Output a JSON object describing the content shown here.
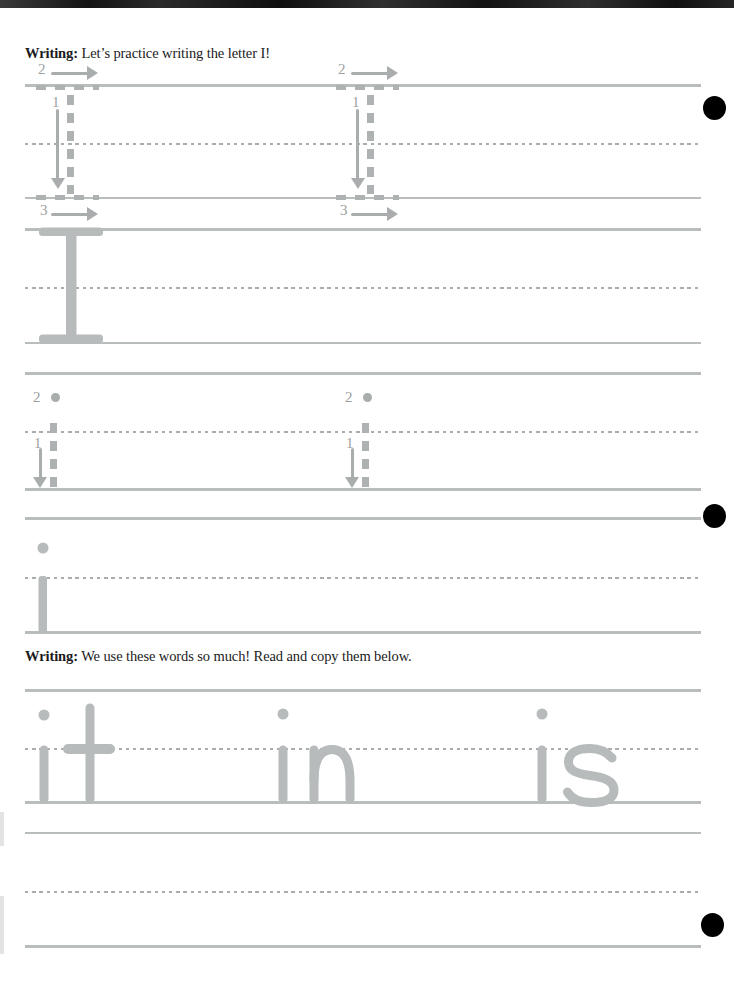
{
  "worksheet": {
    "instruction_uppercase": {
      "label": "Writing:",
      "text": " Let’s practice writing the letter I!"
    },
    "instruction_words": {
      "label": "Writing:",
      "text": " We use these words so much! Read and copy them below."
    },
    "uppercase_letter": "I",
    "lowercase_letter": "i",
    "uppercase_strokes": {
      "stroke_down": "1",
      "stroke_top": "2",
      "stroke_bottom": "3"
    },
    "lowercase_strokes": {
      "stroke_down": "1",
      "stroke_dot": "2"
    },
    "practice_words": [
      "it",
      "in",
      "is"
    ],
    "colors": {
      "guide_line": "#b9bdbd",
      "midline_dash": "#a9adad",
      "template_gray": "#aeb2b2",
      "traced_letter": "#b7bbbb",
      "punch_dot": "#000000",
      "heading_text": "#1b1b1b"
    }
  }
}
